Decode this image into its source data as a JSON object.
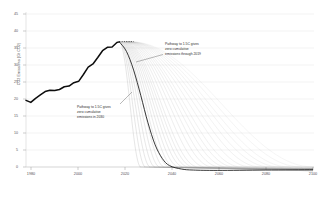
{
  "chart_data": {
    "type": "line",
    "title": "",
    "xlabel": "",
    "ylabel": "CO2 Emissions (Gt CO2)",
    "xlim": [
      1980,
      2100
    ],
    "ylim": [
      0,
      45
    ],
    "grid": true,
    "legend_position": "none",
    "xticks": [
      "1980",
      "2000",
      "2020",
      "2040",
      "2060",
      "2080",
      "2100"
    ],
    "xtick_values": [
      1980,
      2000,
      2020,
      2040,
      2060,
      2080,
      2100
    ],
    "yticks": [
      "0",
      "5",
      "10",
      "15",
      "20",
      "25",
      "30",
      "35",
      "40",
      "45"
    ],
    "ytick_values": [
      0,
      5,
      10,
      15,
      20,
      25,
      30,
      35,
      40,
      45
    ],
    "series": [
      {
        "name": "Historical CO2 emissions",
        "style": "thick-solid",
        "color": "#111111",
        "x": [
          1980,
          1982,
          1984,
          1986,
          1988,
          1990,
          1992,
          1994,
          1996,
          1998,
          2000,
          2002,
          2004,
          2006,
          2008,
          2010,
          2012,
          2014,
          2016,
          2018,
          2019
        ],
        "values": [
          19.6,
          19.0,
          20.2,
          21.2,
          22.2,
          22.6,
          22.5,
          22.8,
          23.6,
          23.8,
          24.8,
          25.2,
          27.2,
          29.4,
          30.3,
          32.2,
          34.2,
          35.2,
          35.3,
          36.6,
          36.8
        ]
      },
      {
        "name": "Peak plateau (dotted extension)",
        "style": "dotted",
        "color": "#222222",
        "x": [
          2019,
          2021,
          2023,
          2025
        ],
        "values": [
          36.8,
          36.9,
          36.9,
          36.9
        ]
      },
      {
        "name": "Mitigation pathway fan (declining scenarios to net zero)",
        "style": "thin-fan",
        "color": "#555555",
        "count": 26,
        "branch_years": [
          2019,
          2019.2,
          2019.4,
          2019.6,
          2019.8,
          2020,
          2020.2,
          2020.4,
          2020.6,
          2020.8,
          2021,
          2021.2,
          2021.4,
          2021.6,
          2021.8,
          2022,
          2022.2,
          2022.4,
          2022.6,
          2022.8,
          2023,
          2023.2,
          2023.4,
          2023.6,
          2023.8,
          2024
        ],
        "net_zero_years": [
          2028,
          2030,
          2032,
          2034,
          2036,
          2038,
          2040,
          2042,
          2044,
          2046,
          2048,
          2050,
          2052,
          2055,
          2058,
          2061,
          2064,
          2067,
          2070,
          2074,
          2078,
          2082,
          2086,
          2090,
          2095,
          2100
        ],
        "note": "each curve declines from the 2019-2024 peak to zero, then asymptotes near zero through 2100"
      },
      {
        "name": "Emphasised 1.5C pathway",
        "style": "medium-solid",
        "color": "#1a1a1a",
        "x": [
          2019,
          2022,
          2025,
          2028,
          2031,
          2034,
          2037,
          2040,
          2045,
          2050,
          2060,
          2080,
          2100
        ],
        "values": [
          36.8,
          34.0,
          28.5,
          21.0,
          13.0,
          6.5,
          2.5,
          0.4,
          -0.6,
          -0.9,
          -1.0,
          -0.9,
          -0.8
        ]
      }
    ],
    "annotations": [
      {
        "id": "annotation-right",
        "lines": [
          "Pathway to 1.5C gives",
          "zero cumulative",
          "emissions through 2019"
        ],
        "leader_from": [
          160,
          55
        ],
        "leader_to": [
          133,
          62
        ]
      },
      {
        "id": "annotation-left",
        "lines": [
          "Pathway to 1.5C gives",
          "zero cumulative",
          "emissions in 2030"
        ],
        "leader_from": [
          120,
          103
        ],
        "leader_to": [
          131,
          93
        ]
      }
    ]
  }
}
